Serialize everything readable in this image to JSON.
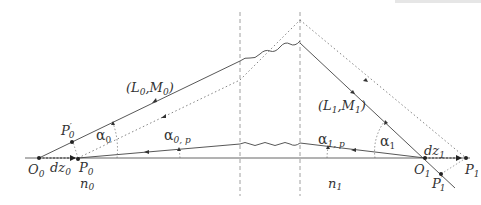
{
  "diagram": {
    "colors": {
      "line": "#444444",
      "dotted": "#666666",
      "dashed": "#888888",
      "text": "#333333"
    },
    "labels": {
      "O0": {
        "main": "O",
        "sub": "0"
      },
      "P0": {
        "main": "P",
        "sub": "0"
      },
      "P0prime": {
        "main": "P",
        "prime": "′",
        "sub": "0"
      },
      "dz0": {
        "main": "dz",
        "sub": "0"
      },
      "n0": {
        "main": "n",
        "sub": "0"
      },
      "L0M0": {
        "open": "(",
        "L": "L",
        "Lsub": "0",
        "comma": ",",
        "M": "M",
        "Msub": "0",
        "close": ")"
      },
      "alpha0": {
        "main": "α",
        "sub": "0"
      },
      "alpha0p": {
        "main": "α",
        "sub": "0, p"
      },
      "alpha1p": {
        "main": "α",
        "sub": "1, p"
      },
      "L1M1": {
        "open": "(",
        "L": "L",
        "Lsub": "1",
        "comma": ",",
        "M": "M",
        "Msub": "1",
        "close": ")"
      },
      "alpha1": {
        "main": "α",
        "sub": "1"
      },
      "n1": {
        "main": "n",
        "sub": "1"
      },
      "dz1": {
        "main": "dz",
        "sub": "1"
      },
      "O1": {
        "main": "O",
        "sub": "1"
      },
      "P1": {
        "main": "P",
        "sub": "1"
      },
      "P1prime": {
        "main": "P",
        "prime": "′",
        "sub": "1"
      }
    },
    "elements": [
      "optical-axis",
      "interface-left (dashed vertical)",
      "interface-right (dashed vertical)",
      "marginal-ray (solid, O0 to O1)",
      "paraxial-ray (solid, near axis)",
      "shifted-ray (dotted, P0 to P1)",
      "wavy segments inside optical system"
    ]
  }
}
